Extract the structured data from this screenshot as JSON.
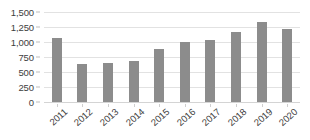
{
  "chart_data": {
    "type": "bar",
    "title": "",
    "subtitle": "",
    "xlabel": "",
    "ylabel": "",
    "categories": [
      "2011",
      "2012",
      "2013",
      "2014",
      "2015",
      "2016",
      "2017",
      "2018",
      "2019",
      "2020"
    ],
    "values": [
      1075,
      635,
      650,
      685,
      890,
      1000,
      1040,
      1170,
      1330,
      1215
    ],
    "series": [
      {
        "name": "",
        "values": [
          1075,
          635,
          650,
          685,
          890,
          1000,
          1040,
          1170,
          1330,
          1215
        ]
      }
    ],
    "ylim": [
      0,
      1500
    ],
    "ytick_values": [
      0,
      250,
      500,
      750,
      1000,
      1250,
      1500
    ],
    "ytick_labels": [
      "0",
      "250",
      "500",
      "750",
      "1,000",
      "1,250",
      "1,500"
    ],
    "grid": true,
    "legend": false,
    "legend_position": "none",
    "bar_color": "#8c8c8c",
    "gridline_color": "#e2e2e2",
    "axis_text_color": "#3d3d3d",
    "background_color": "#ffffff",
    "xtick_label_rotation": -42
  }
}
